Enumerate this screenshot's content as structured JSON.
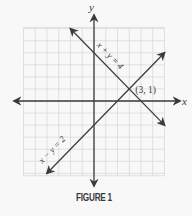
{
  "figure": {
    "caption": "FIGURE 1",
    "axes": {
      "x_label": "x",
      "y_label": "y"
    },
    "grid": {
      "x_min": -6,
      "x_max": 6,
      "y_min": -6.2,
      "y_max": 6.1,
      "step": 1
    },
    "intersection": {
      "x": 3,
      "y": 1,
      "label": "(3, 1)"
    },
    "lines": [
      {
        "name": "x + y = 4",
        "label": "x + y = 4",
        "from": [
          -2,
          6
        ],
        "to": [
          6,
          -2
        ]
      },
      {
        "name": "x − y = 2",
        "label": "x − y = 2",
        "from": [
          -4,
          -6
        ],
        "to": [
          6,
          4
        ]
      }
    ],
    "colors": {
      "background": "#f8f8f8",
      "grid": "#d9d9d9",
      "axis": "#3a3a3a",
      "line": "#3e3e3e",
      "text": "#3a3a3a"
    }
  },
  "chart_data": {
    "type": "line",
    "title": "FIGURE 1",
    "xlabel": "x",
    "ylabel": "y",
    "xlim": [
      -6,
      6
    ],
    "ylim": [
      -6,
      6
    ],
    "grid": true,
    "series": [
      {
        "name": "x + y = 4",
        "x": [
          -2,
          6
        ],
        "y": [
          6,
          -2
        ]
      },
      {
        "name": "x − y = 2",
        "x": [
          -4,
          6
        ],
        "y": [
          -6,
          4
        ]
      }
    ],
    "annotations": [
      {
        "text": "(3, 1)",
        "x": 3,
        "y": 1
      },
      {
        "text": "x + y = 4",
        "along": "x + y = 4"
      },
      {
        "text": "x − y = 2",
        "along": "x − y = 2"
      }
    ]
  }
}
